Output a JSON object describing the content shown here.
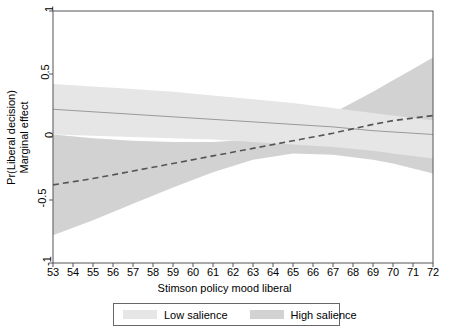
{
  "chart_data": {
    "type": "area",
    "title": "",
    "xlabel": "Stimson policy mood liberal",
    "ylabel_line1": "Pr(Liberal decision)",
    "ylabel_line2": "Marginal effect",
    "xlim": [
      53,
      72
    ],
    "ylim": [
      -1,
      1
    ],
    "grid": false,
    "legend_position": "bottom",
    "xticks": [
      53,
      54,
      55,
      56,
      57,
      58,
      59,
      60,
      61,
      62,
      63,
      64,
      65,
      66,
      67,
      68,
      69,
      70,
      71,
      72
    ],
    "xtick_labels": [
      "53",
      "54",
      "55",
      "56",
      "57",
      "58",
      "59",
      "60",
      "61",
      "62",
      "63",
      "64",
      "65",
      "66",
      "67",
      "68",
      "69",
      "70",
      "71",
      "72"
    ],
    "yticks": [
      -1,
      -0.5,
      0,
      0.5,
      1
    ],
    "ytick_labels": [
      "-1",
      "-0.5",
      "0",
      "0.5",
      "1"
    ],
    "colors": {
      "low_salience_band": "#e6e6e6",
      "high_salience_band": "#d2d2d2",
      "low_salience_line": "#9a9a9a",
      "high_salience_line": "#555555",
      "axis": "#555555",
      "background": "#ffffff"
    },
    "series": [
      {
        "name": "Low salience",
        "style": "solid",
        "x": [
          53,
          55,
          57,
          59,
          61,
          63,
          65,
          67,
          69,
          70,
          71,
          72
        ],
        "values": [
          0.22,
          0.2,
          0.18,
          0.16,
          0.14,
          0.12,
          0.1,
          0.08,
          0.05,
          0.04,
          0.03,
          0.02
        ],
        "ci_upper": [
          0.42,
          0.4,
          0.38,
          0.36,
          0.33,
          0.3,
          0.27,
          0.23,
          0.19,
          0.17,
          0.15,
          0.13
        ],
        "ci_lower": [
          0.02,
          0.01,
          0.0,
          -0.01,
          -0.02,
          -0.04,
          -0.06,
          -0.08,
          -0.11,
          -0.13,
          -0.15,
          -0.17
        ]
      },
      {
        "name": "High salience",
        "style": "dashed",
        "x": [
          53,
          55,
          57,
          59,
          61,
          63,
          65,
          67,
          69,
          70,
          71,
          72
        ],
        "values": [
          -0.38,
          -0.33,
          -0.27,
          -0.21,
          -0.15,
          -0.09,
          -0.03,
          0.03,
          0.1,
          0.13,
          0.15,
          0.17
        ],
        "ci_upper": [
          0.02,
          -0.01,
          -0.03,
          -0.04,
          -0.04,
          -0.02,
          0.06,
          0.19,
          0.36,
          0.45,
          0.54,
          0.63
        ],
        "ci_lower": [
          -0.78,
          -0.66,
          -0.53,
          -0.4,
          -0.28,
          -0.18,
          -0.13,
          -0.14,
          -0.18,
          -0.21,
          -0.25,
          -0.29
        ]
      }
    ],
    "legend": [
      {
        "label": "Low salience",
        "color": "#e6e6e6"
      },
      {
        "label": "High salience",
        "color": "#d2d2d2"
      }
    ]
  }
}
